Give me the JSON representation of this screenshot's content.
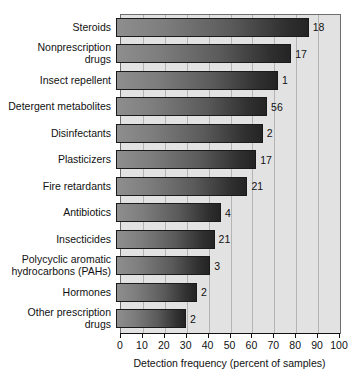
{
  "chart_data": {
    "type": "bar",
    "orientation": "horizontal",
    "title": "",
    "xlabel": "Detection frequency (percent of samples)",
    "ylabel": "",
    "xlim": [
      0,
      100
    ],
    "xticks": [
      0,
      10,
      20,
      30,
      40,
      50,
      60,
      70,
      80,
      90,
      100
    ],
    "grid": true,
    "legend": null,
    "categories": [
      "Steroids",
      "Nonprescription\ndrugs",
      "Insect repellent",
      "Detergent metabolites",
      "Disinfectants",
      "Plasticizers",
      "Fire retardants",
      "Antibiotics",
      "Insecticides",
      "Polycyclic aromatic\nhydrocarbons (PAHs)",
      "Hormones",
      "Other prescription\ndrugs"
    ],
    "values": [
      88,
      80,
      74,
      69,
      67,
      64,
      60,
      48,
      45,
      43,
      37,
      32
    ],
    "point_labels": [
      "18",
      "17",
      "1",
      "56",
      "2",
      "17",
      "21",
      "4",
      "21",
      "3",
      "2",
      "2"
    ],
    "colors": {
      "bar_gradient_start": "#8e8e8e",
      "bar_gradient_end": "#242424",
      "bar_border": "#1a1a1a",
      "plot_background": "#e2e2e2",
      "gridline": "#b4b4b4",
      "frame": "#6e6e6e",
      "text": "#111111",
      "page_background": "#ffffff"
    }
  }
}
